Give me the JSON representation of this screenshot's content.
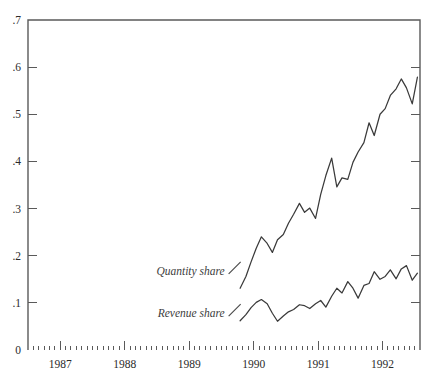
{
  "figure": {
    "background_color": "#ffffff",
    "line_color": "#3a3a3a",
    "axis_color": "#5a5a5a"
  },
  "chart_data": {
    "type": "line",
    "title": "",
    "subtitle": "",
    "xlabel": "",
    "ylabel": "",
    "grid": false,
    "legend_position": "inline-annotations",
    "xlim": [
      1986.5,
      1992.58
    ],
    "ylim": [
      0,
      0.7
    ],
    "ytick_labels": [
      "0",
      ".1",
      ".2",
      ".3",
      ".4",
      ".5",
      ".6",
      ".7"
    ],
    "ytick_values": [
      0,
      0.1,
      0.2,
      0.3,
      0.4,
      0.5,
      0.6,
      0.7
    ],
    "xtick_labels": [
      "1987",
      "1988",
      "1989",
      "1990",
      "1991",
      "1992"
    ],
    "xtick_values": [
      1987,
      1988,
      1989,
      1990,
      1991,
      1992
    ],
    "x_minor_tick_interval_months": 1,
    "annotations": [
      {
        "text": "Quantity share",
        "series": "Quantity share",
        "x": 1989.55,
        "y": 0.168
      },
      {
        "text": "Revenue share",
        "series": "Revenue share",
        "x": 1989.55,
        "y": 0.078
      }
    ],
    "series": [
      {
        "name": "Quantity share",
        "color": "#3a3a3a",
        "x": [
          1989.79,
          1989.88,
          1989.96,
          1990.04,
          1990.12,
          1990.21,
          1990.29,
          1990.37,
          1990.46,
          1990.54,
          1990.62,
          1990.71,
          1990.79,
          1990.87,
          1990.96,
          1991.04,
          1991.12,
          1991.21,
          1991.29,
          1991.37,
          1991.46,
          1991.54,
          1991.62,
          1991.71,
          1991.79,
          1991.87,
          1991.96,
          1992.04,
          1992.12,
          1992.21,
          1992.29,
          1992.37,
          1992.46,
          1992.54
        ],
        "y": [
          0.131,
          0.156,
          0.187,
          0.216,
          0.24,
          0.226,
          0.207,
          0.234,
          0.245,
          0.269,
          0.288,
          0.311,
          0.292,
          0.301,
          0.279,
          0.33,
          0.37,
          0.407,
          0.346,
          0.365,
          0.362,
          0.398,
          0.42,
          0.44,
          0.482,
          0.455,
          0.5,
          0.512,
          0.54,
          0.554,
          0.575,
          0.556,
          0.522,
          0.579
        ]
      },
      {
        "name": "Revenue share",
        "color": "#3a3a3a",
        "x": [
          1989.79,
          1989.88,
          1989.96,
          1990.04,
          1990.12,
          1990.21,
          1990.29,
          1990.37,
          1990.46,
          1990.54,
          1990.62,
          1990.71,
          1990.79,
          1990.87,
          1990.96,
          1991.04,
          1991.12,
          1991.21,
          1991.29,
          1991.37,
          1991.46,
          1991.54,
          1991.62,
          1991.71,
          1991.79,
          1991.87,
          1991.96,
          1992.04,
          1992.12,
          1992.21,
          1992.29,
          1992.37,
          1992.46,
          1992.54
        ],
        "y": [
          0.062,
          0.075,
          0.09,
          0.101,
          0.107,
          0.098,
          0.078,
          0.061,
          0.072,
          0.081,
          0.086,
          0.096,
          0.094,
          0.088,
          0.098,
          0.105,
          0.091,
          0.114,
          0.131,
          0.121,
          0.145,
          0.131,
          0.11,
          0.137,
          0.141,
          0.166,
          0.15,
          0.156,
          0.17,
          0.151,
          0.172,
          0.179,
          0.148,
          0.163
        ]
      }
    ]
  }
}
